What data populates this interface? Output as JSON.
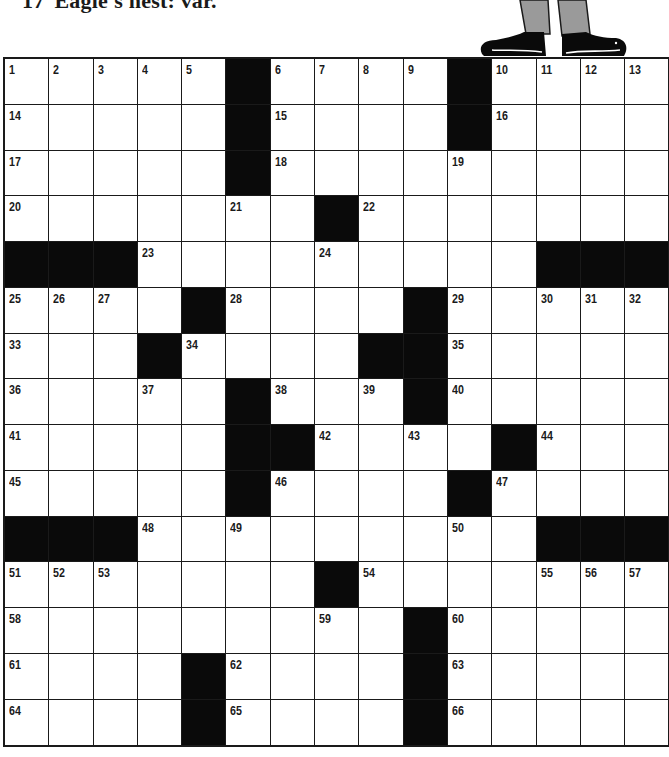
{
  "header_clue": {
    "number": "17",
    "text": "Eagle's nest: var."
  },
  "colors": {
    "ink": "#1a1a1a",
    "black_square": "#0a0a0a",
    "paper": "#ffffff",
    "trousers": "#9a9a9a"
  },
  "grid": {
    "rows": 15,
    "cols": 15,
    "layout": [
      "1,2,3,4,5,#,6,7,8,9,#,10,11,12,13",
      "14,.,.,.,.,#,15,.,.,.,#,16,.,.,.",
      "17,.,.,.,.,#,18,.,.,.,19,.,.,.,.",
      "20,.,.,.,.,21,.,#,22,.,.,.,.,.,.",
      "#,#,#,23,.,.,.,24,.,.,.,.,#,#,#",
      "25,26,27,.,#,28,.,.,.,#,29,.,30,31,32",
      "33,.,.,#,34,.,.,.,#,#,35,.,.,.,.",
      "36,.,.,37,.,#,38,.,39,#,40,.,.,.,.",
      "41,.,.,.,.,#,#,42,.,43,.,#,44,.,.",
      "45,.,.,.,.,#,46,.,.,.,#,47,.,.,.",
      "#,#,#,48,.,49,.,.,.,.,50,.,#,#,#",
      "51,52,53,.,.,.,.,#,54,.,.,.,55,56,57",
      "58,.,.,.,.,.,.,59,.,#,60,.,.,.,.",
      "61,.,.,.,#,62,.,.,.,#,63,.,.,.,.",
      "64,.,.,.,#,65,.,.,.,#,66,.,.,.,."
    ]
  }
}
